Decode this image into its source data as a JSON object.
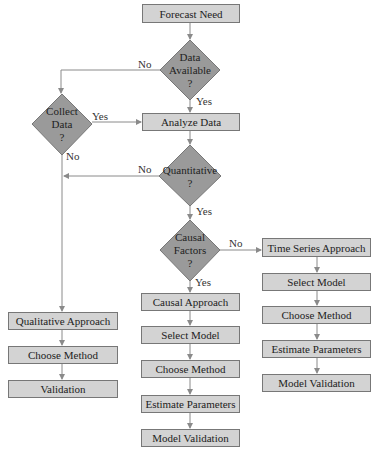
{
  "colors": {
    "box_fill": "#d3d3d3",
    "box_border": "#777777",
    "diamond_fill": "#9a9a9a",
    "line": "#8a8a8a"
  },
  "nodes": {
    "forecast_need": "Forecast Need",
    "data_available": [
      "Data",
      "Available",
      "?"
    ],
    "collect_data": [
      "Collect",
      "Data",
      "?"
    ],
    "analyze_data": "Analyze Data",
    "quantitative": [
      "Quantitative",
      "?"
    ],
    "causal_factors": [
      "Causal",
      "Factors",
      "?"
    ],
    "time_series_approach": "Time Series Approach",
    "ts_select_model": "Select Model",
    "ts_choose_method": "Choose Method",
    "ts_estimate_parameters": "Estimate Parameters",
    "ts_model_validation": "Model Validation",
    "causal_approach": "Causal Approach",
    "ca_select_model": "Select Model",
    "ca_choose_method": "Choose Method",
    "ca_estimate_parameters": "Estimate Parameters",
    "ca_model_validation": "Model Validation",
    "qualitative_approach": "Qualitative Approach",
    "ql_choose_method": "Choose Method",
    "ql_validation": "Validation"
  },
  "edge_labels": {
    "data_available_no": "No",
    "data_available_yes": "Yes",
    "collect_data_yes": "Yes",
    "collect_data_no": "No",
    "quantitative_no": "No",
    "quantitative_yes": "Yes",
    "causal_factors_no": "No",
    "causal_factors_yes": "Yes"
  }
}
